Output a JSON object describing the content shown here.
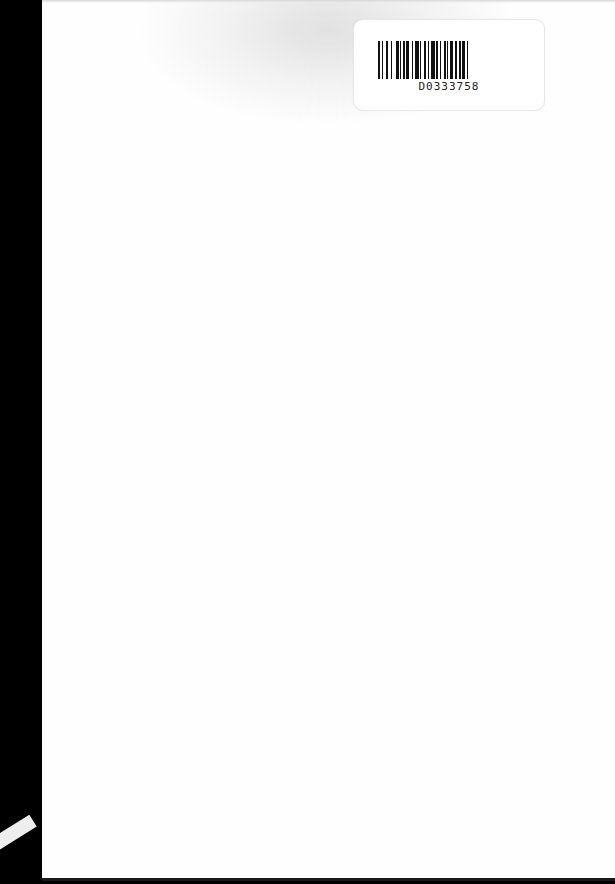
{
  "document": {
    "type": "scanned blank page",
    "background_color": "#fefefe",
    "binding_color": "#000000"
  },
  "barcode_label": {
    "code": "D0333758",
    "icon": "barcode-icon"
  }
}
